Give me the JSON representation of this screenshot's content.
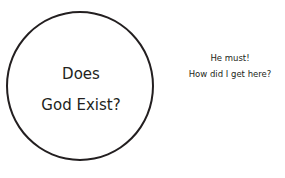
{
  "circle": {
    "line1": "Does",
    "line2": "God Exist?"
  },
  "response": {
    "line1": "He must!",
    "line2": "How did I get here?"
  },
  "colors": {
    "stroke": "#231f20",
    "background": "#ffffff"
  }
}
